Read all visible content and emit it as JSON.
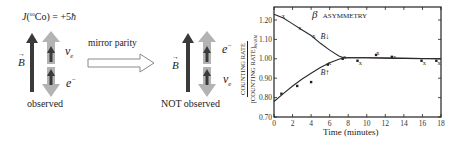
{
  "left_panel": {
    "spin_label": "J(⁶⁰Co) = +5ħ",
    "spin_label_parts": {
      "J": "J",
      "open": "(",
      "isotope_mass": "60",
      "element": "Co",
      "close": ")",
      "equals": " = +5",
      "hbar": "ħ"
    },
    "b_field_label": "B",
    "top_particle": "ν",
    "top_particle_sub": "e",
    "bottom_particle": "e",
    "bottom_particle_sup": "−",
    "caption": "observed"
  },
  "transform": {
    "label": "mirror parity"
  },
  "right_panel": {
    "b_field_label": "B",
    "top_particle": "e",
    "top_particle_sup": "−",
    "bottom_particle": "ν",
    "bottom_particle_sub": "e",
    "caption": "NOT observed"
  },
  "colors": {
    "dark_arrow": "#3a3a3a",
    "gray_arrow": "#b0b0b0",
    "axis": "#222222"
  },
  "chart_data": {
    "type": "scatter",
    "title": "β ASYMMETRY",
    "title_parts": {
      "beta": "β",
      "text": "ASYMMETRY"
    },
    "xlabel": "Time (minutes)",
    "ylabel_numerator": "COUNTING RATE",
    "ylabel_denominator": "[COUNTING RATE]",
    "ylabel_subscript": "WARM",
    "xlim": [
      0,
      18
    ],
    "ylim": [
      0.7,
      1.26
    ],
    "xticks": [
      "0",
      "2",
      "4",
      "6",
      "8",
      "10",
      "12",
      "14",
      "16",
      "18"
    ],
    "yticks": [
      "0.70",
      "0.80",
      "0.90",
      "1.00",
      "1.10",
      "1.20"
    ],
    "grid": false,
    "annotations": [
      {
        "text": "B↓",
        "x": 5.0,
        "y": 1.12
      },
      {
        "text": "B↑",
        "x": 5.0,
        "y": 0.93
      }
    ],
    "series": [
      {
        "name": "B down (x markers)",
        "marker": "x",
        "x": [
          1.0,
          2.8,
          4.3,
          6.0,
          7.6,
          9.3,
          11.2,
          13.0,
          16.2,
          17.8
        ],
        "y": [
          1.22,
          1.16,
          1.12,
          0.98,
          1.01,
          0.98,
          1.03,
          1.01,
          0.98,
          0.98
        ]
      },
      {
        "name": "B up (dot markers)",
        "marker": "dot",
        "x": [
          0.8,
          2.5,
          4.0,
          5.8,
          7.4,
          9.0,
          11.0,
          12.7,
          15.9,
          17.5
        ],
        "y": [
          0.82,
          0.86,
          0.88,
          0.97,
          1.0,
          0.99,
          1.02,
          1.01,
          0.99,
          0.99
        ]
      },
      {
        "name": "B down fit curve",
        "marker": "line",
        "x": [
          0,
          1,
          2,
          3,
          4,
          5,
          6,
          7,
          7.5,
          10,
          14,
          18
        ],
        "y": [
          1.23,
          1.21,
          1.18,
          1.15,
          1.12,
          1.08,
          1.045,
          1.015,
          1.005,
          1.005,
          1.002,
          1.0
        ]
      },
      {
        "name": "B up fit curve",
        "marker": "line",
        "x": [
          0,
          1,
          2,
          3,
          4,
          5,
          6,
          7,
          7.5,
          10,
          14,
          18
        ],
        "y": [
          0.78,
          0.82,
          0.86,
          0.895,
          0.925,
          0.955,
          0.98,
          0.998,
          1.005,
          1.005,
          1.002,
          1.0
        ]
      }
    ]
  }
}
